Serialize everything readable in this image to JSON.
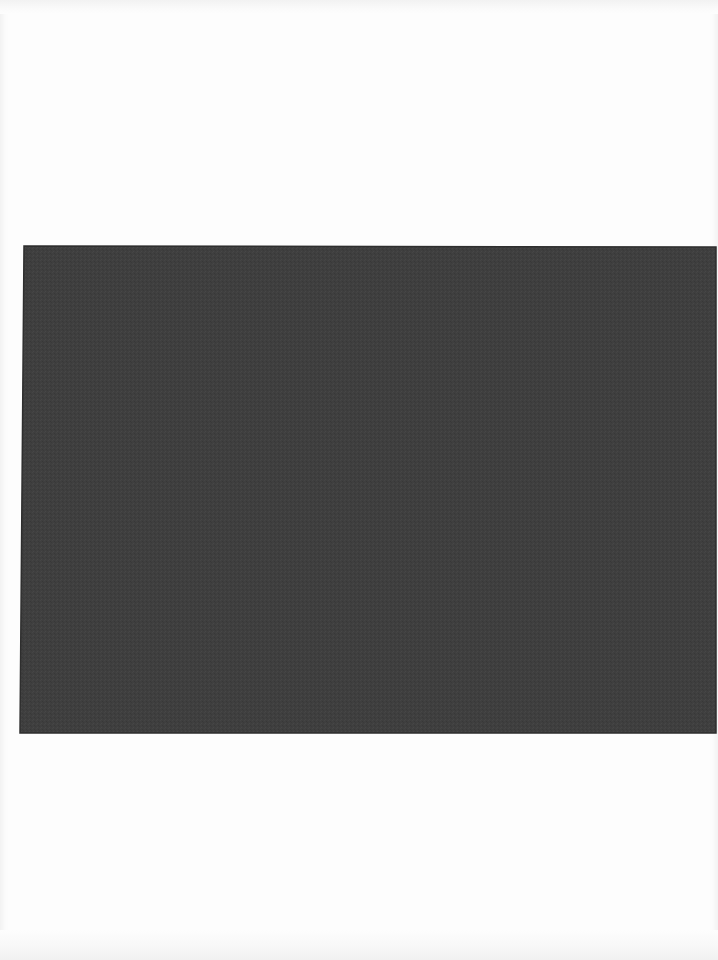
{
  "document": {
    "type": "scanned-page",
    "background_color": "#fdfdfd",
    "plate": {
      "description": "solid dark gray rectangular plate/image area, no visible content",
      "color": "#3f3f3f",
      "edge_color": "#2e2e2e",
      "corners": {
        "top_left": [
          24,
          246
        ],
        "top_right": [
          716,
          247
        ],
        "bottom_right": [
          716,
          733
        ],
        "bottom_left": [
          20,
          733
        ]
      }
    }
  }
}
